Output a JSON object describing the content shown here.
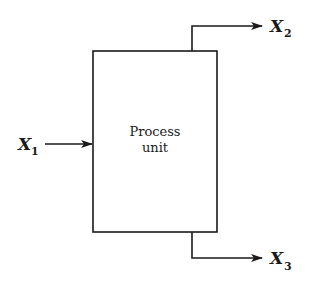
{
  "diagram": {
    "type": "block-flow",
    "unit": {
      "line1": "Process",
      "line2": "unit"
    },
    "streams": [
      {
        "id": "x1",
        "var": "X",
        "sub": "1",
        "direction": "input"
      },
      {
        "id": "x2",
        "var": "X",
        "sub": "2",
        "direction": "output-top"
      },
      {
        "id": "x3",
        "var": "X",
        "sub": "3",
        "direction": "output-bottom"
      }
    ],
    "colors": {
      "line": "#1a1a1a",
      "background": "#ffffff"
    }
  }
}
